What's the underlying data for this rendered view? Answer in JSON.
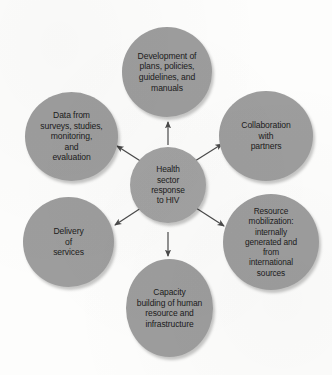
{
  "diagram": {
    "title": "Health sector response to HIV",
    "type": "hub-and-spoke",
    "background_color": "#fdfdfc",
    "node_color": "#9d9d9d",
    "text_color": "#1b1b1b",
    "arrow_color": "#4a4a4a",
    "center": {
      "id": "center",
      "label": "Health\nsector\nresponse\nto HIV"
    },
    "spokes": [
      {
        "id": "top",
        "label": "Development of\nplans, policies,\nguidelines, and\nmanuals",
        "position": "top",
        "arrow": "center-to-node"
      },
      {
        "id": "data",
        "label": "Data from\nsurveys, studies,\nmonitoring,\nand\nevaluation",
        "position": "upper-left",
        "arrow": "center-to-node"
      },
      {
        "id": "collab",
        "label": "Collaboration\nwith\npartners",
        "position": "upper-right",
        "arrow": "center-to-node"
      },
      {
        "id": "delivery",
        "label": "Delivery\nof\nservices",
        "position": "lower-left",
        "arrow": "center-to-node"
      },
      {
        "id": "resource",
        "label": "Resource\nmobilization:\ninternally\ngenerated and\nfrom\ninternational\nsources",
        "position": "lower-right",
        "arrow": "center-to-node"
      },
      {
        "id": "capacity",
        "label": "Capacity\nbuilding of human\nresource and\ninfrastructure",
        "position": "bottom",
        "arrow": "center-to-node"
      }
    ]
  }
}
